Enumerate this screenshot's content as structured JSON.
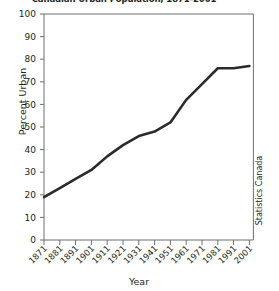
{
  "chart_data": {
    "type": "line",
    "title": "Canadian Urban Population, 1871-2001",
    "xlabel": "Year",
    "ylabel": "Percent Urban",
    "source": "Statistics Canada",
    "grid": false,
    "legend": null,
    "xlim": [
      1871,
      2001
    ],
    "ylim": [
      0,
      100
    ],
    "yticks": [
      0,
      10,
      20,
      30,
      40,
      50,
      60,
      70,
      80,
      90,
      100
    ],
    "categories": [
      "1871",
      "1881",
      "1891",
      "1901",
      "1911",
      "1921",
      "1931",
      "1941",
      "1951",
      "1961",
      "1971",
      "1981",
      "1991",
      "2001"
    ],
    "values": [
      19,
      23,
      27,
      31,
      37,
      42,
      46,
      48,
      52,
      62,
      69,
      76,
      76,
      77
    ],
    "series_name": "Percent Urban",
    "line_color": "#2b2b2b",
    "axis_color": "#6d6e71",
    "text_color": "#231f20",
    "background": "#ffffff"
  }
}
